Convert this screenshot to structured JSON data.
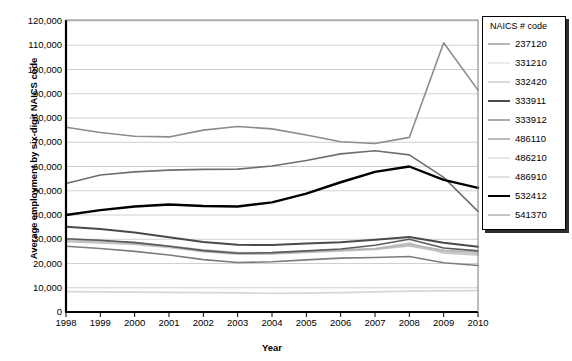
{
  "chart_data": {
    "type": "line",
    "title": "",
    "xlabel": "Year",
    "ylabel": "Average employment by six-digit NAICS code",
    "legend_title": "NAICS # code",
    "legend_position": "right",
    "grid": true,
    "x": [
      1998,
      1999,
      2000,
      2001,
      2002,
      2003,
      2004,
      2005,
      2006,
      2007,
      2008,
      2009,
      2010
    ],
    "xtick_labels": [
      "1998",
      "1999",
      "2000",
      "2001",
      "2002",
      "2003",
      "2004",
      "2005",
      "2006",
      "2007",
      "2008",
      "2009",
      "2010"
    ],
    "xlim": [
      1998,
      2010
    ],
    "ylim": [
      0,
      120000
    ],
    "ytick_labels": [
      "0",
      "10,000",
      "20,000",
      "30,000",
      "40,000",
      "50,000",
      "60,000",
      "70,000",
      "80,000",
      "90,000",
      "100,000",
      "110,000",
      "120,000"
    ],
    "ytick_values": [
      0,
      10000,
      20000,
      30000,
      40000,
      50000,
      60000,
      70000,
      80000,
      90000,
      100000,
      110000,
      120000
    ],
    "series": [
      {
        "name": "237120",
        "color": "#6e6e6e",
        "width": 1.6,
        "values": [
          53000,
          56500,
          57800,
          58500,
          58800,
          58900,
          60200,
          62500,
          65200,
          66500,
          64800,
          55500,
          41500
        ]
      },
      {
        "name": "331210",
        "color": "#d8d8d8",
        "width": 1.6,
        "values": [
          8400,
          8300,
          8200,
          8100,
          8000,
          7900,
          7700,
          7800,
          8000,
          8300,
          8600,
          8700,
          8800
        ]
      },
      {
        "name": "332420",
        "color": "#b4b4b4",
        "width": 1.6,
        "values": [
          29800,
          29300,
          28700,
          27200,
          25500,
          24300,
          24100,
          24800,
          25500,
          26100,
          27900,
          25400,
          24700
        ]
      },
      {
        "name": "333911",
        "color": "#4a4a4a",
        "width": 2.0,
        "values": [
          35200,
          34200,
          32800,
          30800,
          28900,
          27700,
          27600,
          28200,
          28800,
          29800,
          30900,
          28600,
          26900
        ]
      },
      {
        "name": "333912",
        "color": "#5a5a5a",
        "width": 1.6,
        "values": [
          30200,
          29600,
          28600,
          27100,
          25300,
          24200,
          24500,
          25200,
          26000,
          27500,
          30000,
          26400,
          25200
        ]
      },
      {
        "name": "486110",
        "color": "#7d7d7d",
        "width": 1.6,
        "values": [
          27100,
          26200,
          25000,
          23500,
          21600,
          20400,
          20700,
          21500,
          22200,
          22500,
          22900,
          20300,
          19200
        ]
      },
      {
        "name": "486210",
        "color": "#cfcfcf",
        "width": 1.6,
        "values": [
          29300,
          28800,
          28200,
          27000,
          25600,
          24600,
          24400,
          25000,
          25600,
          26200,
          28500,
          24200,
          23400
        ]
      },
      {
        "name": "486910",
        "color": "#c2c2c2",
        "width": 1.6,
        "values": [
          29000,
          28500,
          27900,
          26600,
          24900,
          23800,
          23900,
          24600,
          25200,
          25800,
          27200,
          24800,
          23900
        ]
      },
      {
        "name": "532412",
        "color": "#000000",
        "width": 2.4,
        "values": [
          40000,
          42000,
          43500,
          44300,
          43700,
          43500,
          45200,
          48800,
          53500,
          57800,
          60000,
          54500,
          51200
        ]
      },
      {
        "name": "541370",
        "color": "#8c8c8c",
        "width": 1.6,
        "values": [
          76200,
          74000,
          72500,
          72200,
          75000,
          76500,
          75500,
          73000,
          70200,
          69500,
          72000,
          111000,
          91500
        ]
      }
    ]
  }
}
